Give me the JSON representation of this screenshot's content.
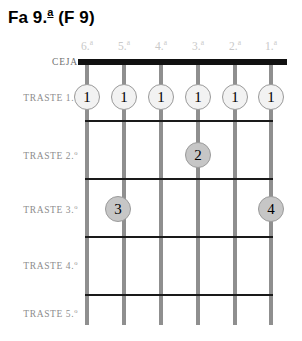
{
  "title": {
    "base": "Fa 9.",
    "ordinal": "a",
    "paren": " (F 9)",
    "full": "Fa 9.ª (F 9)"
  },
  "geometry": {
    "string_x": [
      87,
      124,
      161,
      198,
      235,
      271
    ],
    "fret_y": [
      62,
      120,
      178,
      236,
      294
    ],
    "board_left": 78,
    "board_right": 287,
    "string_bottom": 325
  },
  "colors": {
    "nut": "#111111",
    "fret_line": "#1a1a1a",
    "string": "#8f8f8f",
    "dot_open_fill": "#f2f2f2",
    "dot_filled_fill": "#c6c6c6",
    "dot_stroke": "#9a9a9a",
    "string_label": "#c9c9c9",
    "fret_label": "#8d8d8d",
    "title": "#000000",
    "background": "#ffffff"
  },
  "strings": [
    {
      "id": "string-6",
      "label_base": "6.",
      "label_ord": "a",
      "label_full": "6.ª",
      "x": 87
    },
    {
      "id": "string-5",
      "label_base": "5.",
      "label_ord": "a",
      "label_full": "5.ª",
      "x": 124
    },
    {
      "id": "string-4",
      "label_base": "4.",
      "label_ord": "a",
      "label_full": "4.ª",
      "x": 161
    },
    {
      "id": "string-3",
      "label_base": "3.",
      "label_ord": "a",
      "label_full": "3.ª",
      "x": 198
    },
    {
      "id": "string-2",
      "label_base": "2.",
      "label_ord": "a",
      "label_full": "2.ª",
      "x": 235
    },
    {
      "id": "string-1",
      "label_base": "1.",
      "label_ord": "a",
      "label_full": "1.ª",
      "x": 271
    }
  ],
  "frets": [
    {
      "id": "nut",
      "label_base": "CEJA",
      "label_ord": "",
      "label_full": "CEJA",
      "y": 62,
      "row_center": 62
    },
    {
      "id": "fret-1",
      "label_base": "TRASTE 1.",
      "label_ord": "o",
      "label_full": "TRASTE 1.º",
      "y": 120,
      "row_center": 97
    },
    {
      "id": "fret-2",
      "label_base": "TRASTE 2.",
      "label_ord": "o",
      "label_full": "TRASTE 2.º",
      "y": 178,
      "row_center": 155
    },
    {
      "id": "fret-3",
      "label_base": "TRASTE 3.",
      "label_ord": "o",
      "label_full": "TRASTE 3.º",
      "y": 236,
      "row_center": 209
    },
    {
      "id": "fret-4",
      "label_base": "TRASTE 4.",
      "label_ord": "o",
      "label_full": "TRASTE 4.º",
      "y": 294,
      "row_center": 265
    },
    {
      "id": "fret-5",
      "label_base": "TRASTE 5.",
      "label_ord": "o",
      "label_full": "TRASTE 5.º",
      "y": 325,
      "row_center": 313
    }
  ],
  "fingerings": [
    {
      "id": "dot-s6-f1",
      "finger": "1",
      "string": 6,
      "fret": 1,
      "style": "open",
      "x": 87,
      "y": 97
    },
    {
      "id": "dot-s5-f1",
      "finger": "1",
      "string": 5,
      "fret": 1,
      "style": "open",
      "x": 124,
      "y": 97
    },
    {
      "id": "dot-s4-f1",
      "finger": "1",
      "string": 4,
      "fret": 1,
      "style": "open",
      "x": 161,
      "y": 97
    },
    {
      "id": "dot-s3-f1",
      "finger": "1",
      "string": 3,
      "fret": 1,
      "style": "open",
      "x": 198,
      "y": 97
    },
    {
      "id": "dot-s2-f1",
      "finger": "1",
      "string": 2,
      "fret": 1,
      "style": "open",
      "x": 235,
      "y": 97
    },
    {
      "id": "dot-s1-f1",
      "finger": "1",
      "string": 1,
      "fret": 1,
      "style": "open",
      "x": 271,
      "y": 97
    },
    {
      "id": "dot-s3-f2",
      "finger": "2",
      "string": 3,
      "fret": 2,
      "style": "filled",
      "x": 198,
      "y": 155
    },
    {
      "id": "dot-s5-f3",
      "finger": "3",
      "string": 5,
      "fret": 3,
      "style": "filled",
      "x": 118,
      "y": 209
    },
    {
      "id": "dot-s1-f3",
      "finger": "4",
      "string": 1,
      "fret": 3,
      "style": "filled",
      "x": 271,
      "y": 209
    }
  ]
}
